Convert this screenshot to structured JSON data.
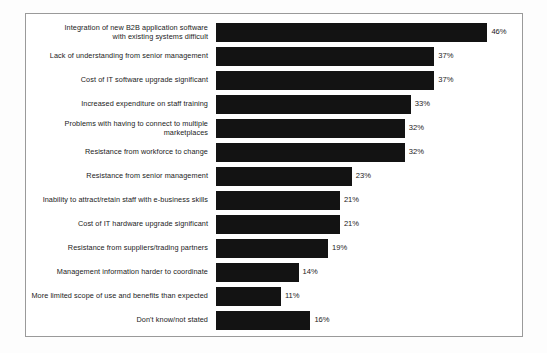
{
  "chart_data": {
    "type": "bar",
    "orientation": "horizontal",
    "title": "",
    "subtitle": "",
    "xlabel": "",
    "ylabel": "",
    "xlim": [
      0,
      50
    ],
    "grid": false,
    "legend": null,
    "value_suffix": "%",
    "bar_color": "#131313",
    "categories": [
      "Integration of new B2B application software\nwith existing systems difficult",
      "Lack of understanding from senior management",
      "Cost of IT software upgrade significant",
      "Increased expenditure on staff training",
      "Problems with having to connect to multiple marketplaces",
      "Resistance from workforce to change",
      "Resistance from senior management",
      "Inability to attract/retain staff with e-business skills",
      "Cost of IT hardware upgrade significant",
      "Resistance from suppliers/trading partners",
      "Management information harder to coordinate",
      "More limited scope of use and benefits than expected",
      "Don't know/not stated"
    ],
    "values": [
      46,
      37,
      37,
      33,
      32,
      32,
      23,
      21,
      21,
      19,
      14,
      11,
      16
    ],
    "value_labels": [
      "46%",
      "37%",
      "37%",
      "33%",
      "32%",
      "32%",
      "23%",
      "21%",
      "21%",
      "19%",
      "14%",
      "11%",
      "16%"
    ]
  },
  "frame": {
    "border_color": "#9a9a9a",
    "background": "#ffffff"
  }
}
